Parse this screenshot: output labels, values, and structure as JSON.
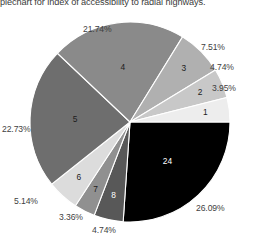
{
  "chart_data": {
    "type": "pie",
    "title": "piechart for index of accessibility to radial highways.",
    "xlabel": "",
    "ylabel": "",
    "legend": "none",
    "grid": false,
    "start_angle_deg": 0,
    "direction": "clockwise",
    "categories": [
      "24",
      "8",
      "7",
      "6",
      "5",
      "4",
      "3",
      "2",
      "1"
    ],
    "values": [
      26.09,
      4.74,
      3.36,
      5.14,
      22.73,
      21.74,
      7.51,
      4.74,
      3.95
    ],
    "percent_labels": [
      "26.09%",
      "4.74%",
      "3.36%",
      "5.14%",
      "22.73%",
      "21.74%",
      "7.51%",
      "4.74%",
      "3.95%"
    ],
    "colors": [
      "#000000",
      "#585858",
      "#909090",
      "#dcdcdc",
      "#6e6e6e",
      "#8a8a8a",
      "#b0b0b0",
      "#c8c8c8",
      "#ededed"
    ],
    "slices": [
      {
        "category": "24",
        "value": 26.09,
        "percent_label": "26.09%",
        "color": "#000000",
        "label_color": "light"
      },
      {
        "category": "8",
        "value": 4.74,
        "percent_label": "4.74%",
        "color": "#585858",
        "label_color": "light"
      },
      {
        "category": "7",
        "value": 3.36,
        "percent_label": "3.36%",
        "color": "#909090",
        "label_color": "dark"
      },
      {
        "category": "6",
        "value": 5.14,
        "percent_label": "5.14%",
        "color": "#dcdcdc",
        "label_color": "dark"
      },
      {
        "category": "5",
        "value": 22.73,
        "percent_label": "22.73%",
        "color": "#6e6e6e",
        "label_color": "dark"
      },
      {
        "category": "4",
        "value": 21.74,
        "percent_label": "21.74%",
        "color": "#8a8a8a",
        "label_color": "dark"
      },
      {
        "category": "3",
        "value": 7.51,
        "percent_label": "7.51%",
        "color": "#b0b0b0",
        "label_color": "dark"
      },
      {
        "category": "2",
        "value": 4.74,
        "percent_label": "4.74%",
        "color": "#c8c8c8",
        "label_color": "dark"
      },
      {
        "category": "1",
        "value": 3.95,
        "percent_label": "3.95%",
        "color": "#ededed",
        "label_color": "dark"
      }
    ]
  },
  "callouts": {
    "pct_24": "26.09%",
    "pct_8": "4.74%",
    "pct_7": "3.36%",
    "pct_6": "5.14%",
    "pct_5": "22.73%",
    "pct_4": "21.74%",
    "pct_3": "7.51%",
    "pct_2": "4.74%",
    "pct_1": "3.95%"
  }
}
